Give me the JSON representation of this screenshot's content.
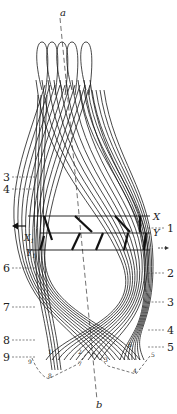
{
  "figure": {
    "axis_top_label": "a",
    "axis_bottom_label": "b",
    "row_labels": {
      "x": "X",
      "y": "Y",
      "x1": "X",
      "x1_sub": "1",
      "y1": "Y",
      "y1_sub": "1"
    },
    "direction_arrows": {
      "left": "←",
      "right": "→"
    },
    "left_labels": [
      "3",
      "4",
      "6",
      "7",
      "8",
      "9"
    ],
    "right_labels": [
      "1",
      "2",
      "3",
      "4",
      "5"
    ],
    "bottom_points": [
      "9",
      "8",
      "1",
      "7",
      "2",
      "3",
      "6",
      "4",
      "5"
    ],
    "ink_color": "#1a1a1a"
  }
}
